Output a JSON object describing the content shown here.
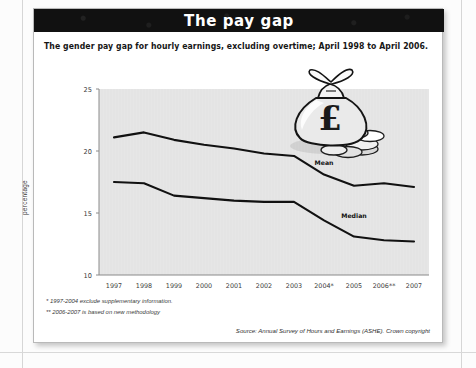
{
  "card": {
    "title": "The pay gap",
    "subtitle": "The gender pay gap for hourly earnings, excluding overtime; April 1998 to April 2006.",
    "footnote_1": "* 1997-2004 exclude supplementary information.",
    "footnote_2": "** 2006-2007 is based on new methodology",
    "source": "Source: Annual Survey of Hours and Earnings (ASHE). Crown copyright"
  },
  "decoration": {
    "money_bag_icon": "money-bag-pound-icon",
    "currency_symbol": "£"
  },
  "colors": {
    "title_bar": "#111111",
    "title_text": "#ffffff",
    "plot_background": "#e6e6e6",
    "line": "#111111",
    "card_background": "#ffffff",
    "page_background": "#fcfcfc"
  },
  "chart_data": {
    "type": "line",
    "title": "The pay gap",
    "subtitle": "The gender pay gap for hourly earnings, excluding overtime; April 1998 to April 2006.",
    "xlabel": "",
    "ylabel": "percentage",
    "ylim": [
      10,
      25
    ],
    "yticks": [
      10,
      15,
      20,
      25
    ],
    "ytick_labels": [
      "10",
      "15",
      "20",
      "25"
    ],
    "grid": false,
    "legend": "inline-labels",
    "categories": [
      "1997",
      "1998",
      "1999",
      "2000",
      "2001",
      "2002",
      "2003",
      "2004*",
      "2005",
      "2006**",
      "2007"
    ],
    "x": [
      1997,
      1998,
      1999,
      2000,
      2001,
      2002,
      2003,
      2004,
      2005,
      2006,
      2007
    ],
    "series": [
      {
        "name": "Mean",
        "label": "Mean",
        "values": [
          21.1,
          21.5,
          20.9,
          20.5,
          20.2,
          19.8,
          19.6,
          18.1,
          17.2,
          17.4,
          17.1
        ]
      },
      {
        "name": "Median",
        "label": "Median",
        "values": [
          17.5,
          17.4,
          16.4,
          16.2,
          16.0,
          15.9,
          15.9,
          14.4,
          13.1,
          12.8,
          12.7
        ]
      }
    ],
    "annotations": [
      {
        "text": "Mean",
        "x": 2004,
        "y": 18.9
      },
      {
        "text": "Median",
        "x": 2005,
        "y": 14.6
      }
    ]
  }
}
